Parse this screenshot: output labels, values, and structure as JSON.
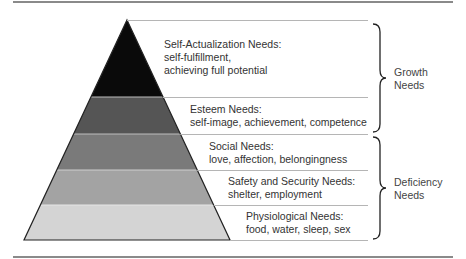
{
  "levels": [
    {
      "name": "Self-Actualization Needs:",
      "line1": "self-fulfillment,",
      "line2": "achieving full potential",
      "color": "#0a0a0a"
    },
    {
      "name": "Esteem Needs:",
      "line1": "self-image, achievement, competence",
      "color": "#555555"
    },
    {
      "name": "Social Needs:",
      "line1": "love, affection, belongingness",
      "color": "#7a7a7a"
    },
    {
      "name": "Safety and Security Needs:",
      "line1": "shelter, employment",
      "color": "#a3a3a3"
    },
    {
      "name": "Physiological Needs:",
      "line1": "food, water, sleep, sex",
      "color": "#d4d4d4"
    }
  ],
  "groups": [
    {
      "line1": "Growth",
      "line2": "Needs",
      "covers": [
        "Self-Actualization",
        "Esteem"
      ]
    },
    {
      "line1": "Deficiency",
      "line2": "Needs",
      "covers": [
        "Social",
        "Safety and Security",
        "Physiological"
      ]
    }
  ]
}
